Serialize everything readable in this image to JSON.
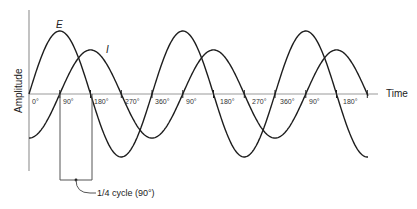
{
  "diagram": {
    "title": "",
    "y_axis_label": "Amplitude",
    "x_axis_label": "Time",
    "curve_labels": {
      "voltage": "E",
      "current": "I"
    },
    "tick_labels": [
      "0°",
      "90°",
      "180°",
      "270°",
      "360°",
      "90°",
      "180°",
      "270°",
      "360°",
      "90°",
      "180°"
    ],
    "annotation": "1/4 cycle (90°)",
    "colors": {
      "curve": "#1e1e1e",
      "axis": "#9a9a9a",
      "text": "#222222"
    }
  },
  "chart_data": {
    "type": "line",
    "title": "",
    "xlabel": "Time",
    "ylabel": "Amplitude",
    "x_unit": "degrees",
    "x_range_deg": [
      0,
      1080
    ],
    "series": [
      {
        "name": "E",
        "function": "sine",
        "amplitude_rel": 1.0,
        "phase_deg": 0
      },
      {
        "name": "I",
        "function": "sine",
        "amplitude_rel": 0.7,
        "phase_deg": -90
      }
    ],
    "annotations": [
      {
        "text": "1/4 cycle (90°)",
        "from_deg": 90,
        "to_deg": 180
      }
    ]
  }
}
